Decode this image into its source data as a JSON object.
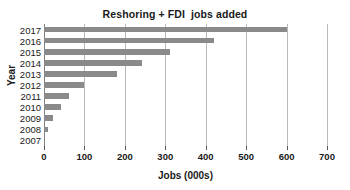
{
  "chart_data": {
    "type": "bar",
    "orientation": "horizontal",
    "title": "Reshoring + FDI  jobs added",
    "xlabel": "Jobs (000s)",
    "ylabel": "Year",
    "categories": [
      "2017",
      "2016",
      "2015",
      "2014",
      "2013",
      "2012",
      "2011",
      "2010",
      "2009",
      "2008",
      "2007"
    ],
    "values": [
      600,
      420,
      312,
      243,
      181,
      100,
      62,
      42,
      22,
      10,
      0
    ],
    "xlim": [
      0,
      700
    ],
    "xticks": [
      0,
      100,
      200,
      300,
      400,
      500,
      600,
      700
    ],
    "xtick_labels": [
      "0",
      "100",
      "200",
      "300",
      "400",
      "500",
      "600",
      "700"
    ],
    "grid": "vertical",
    "legend": null,
    "bar_color": "#8a8a8a",
    "gridline_color": "#b9b9b9",
    "axis_color": "#808080",
    "background_color": "#ffffff",
    "text_color": "#1a1a1a"
  }
}
